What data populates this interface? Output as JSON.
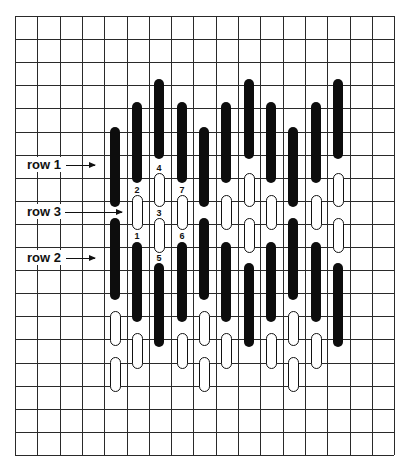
{
  "diagram": {
    "grid": {
      "left": 15,
      "top": 16,
      "cols": 17,
      "rows": 19,
      "cell_w": 22.3,
      "cell_h": 23.1,
      "line_color": "#2a2a2a"
    },
    "colors": {
      "filled": "#0d0d0d",
      "open_fill": "#ffffff",
      "open_border": "#111111",
      "background": "#ffffff"
    },
    "labels": [
      {
        "text": "row 1",
        "x": 24,
        "y": 157,
        "arrow": {
          "x1": 66,
          "x2": 101,
          "y": 165
        }
      },
      {
        "text": "row 3",
        "x": 24,
        "y": 204,
        "arrow": {
          "x1": 65,
          "x2": 128,
          "y": 212
        }
      },
      {
        "text": "row 2",
        "x": 24,
        "y": 250,
        "arrow": {
          "x1": 66,
          "x2": 101,
          "y": 258
        }
      }
    ],
    "step_numbers": [
      {
        "text": "1",
        "x": 137,
        "y": 236
      },
      {
        "text": "2",
        "x": 137,
        "y": 190
      },
      {
        "text": "3",
        "x": 159,
        "y": 213
      },
      {
        "text": "4",
        "x": 159,
        "y": 168
      },
      {
        "text": "5",
        "x": 159,
        "y": 258
      },
      {
        "text": "6",
        "x": 182,
        "y": 236
      },
      {
        "text": "7",
        "x": 182,
        "y": 190
      }
    ],
    "column_x": [
      115,
      137,
      159,
      182,
      204,
      226,
      249,
      271,
      293,
      316,
      338
    ],
    "column_types": [
      "A",
      "B",
      "C",
      "B",
      "A",
      "B",
      "C",
      "B",
      "A",
      "B",
      "C"
    ],
    "stitch_types": {
      "A": [
        {
          "kind": "filled",
          "top": 127,
          "bottom": 207
        },
        {
          "kind": "filled",
          "top": 218,
          "bottom": 300
        },
        {
          "kind": "open",
          "top": 311,
          "bottom": 346
        },
        {
          "kind": "open",
          "top": 357,
          "bottom": 392
        }
      ],
      "B": [
        {
          "kind": "filled",
          "top": 102,
          "bottom": 183
        },
        {
          "kind": "open",
          "top": 195,
          "bottom": 230
        },
        {
          "kind": "filled",
          "top": 242,
          "bottom": 322
        },
        {
          "kind": "open",
          "top": 333,
          "bottom": 369
        }
      ],
      "C": [
        {
          "kind": "filled",
          "top": 79,
          "bottom": 159
        },
        {
          "kind": "open",
          "top": 173,
          "bottom": 207
        },
        {
          "kind": "open",
          "top": 218,
          "bottom": 253
        },
        {
          "kind": "filled",
          "top": 263,
          "bottom": 347
        }
      ]
    }
  }
}
